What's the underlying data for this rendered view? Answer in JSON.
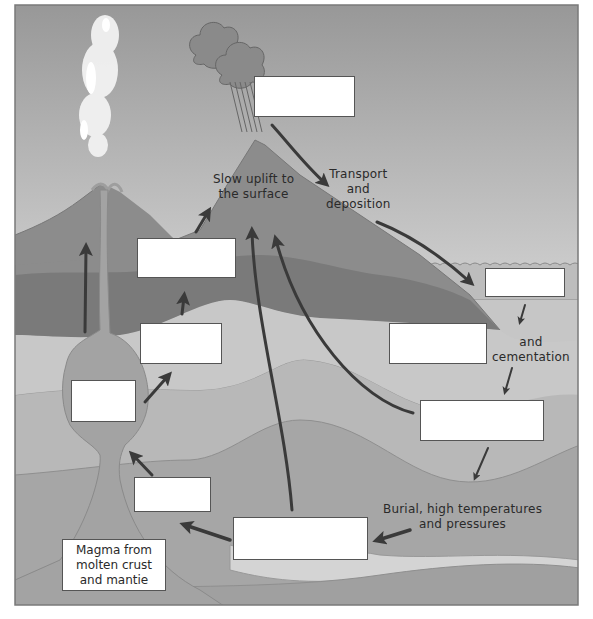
{
  "diagram": {
    "colors": {
      "sky_top": "#9a9a9a",
      "sky_bottom": "#f4f4f4",
      "mountain_light": "#8a8a8a",
      "mountain_dark": "#777777",
      "layer_light": "#c6c6c6",
      "layer_mid": "#b3b3b3",
      "layer_deep": "#a2a2a2",
      "magma": "#9c9c9c",
      "water": "#bdbdbd",
      "arrow": "#3a3a3a"
    },
    "labels": {
      "uplift": [
        "Slow uplift to",
        "the surface"
      ],
      "transport": [
        "Transport",
        "and",
        "deposition"
      ],
      "cementation": [
        "and",
        "cementation"
      ],
      "burial": [
        "Burial, high temperatures",
        "and pressures"
      ],
      "magma": [
        "Magma from",
        "molten crust",
        "and mantie"
      ]
    },
    "blank_boxes": [
      {
        "id": "weathering",
        "value": ""
      },
      {
        "id": "sediment",
        "value": ""
      },
      {
        "id": "sedimentary-rock",
        "value": ""
      },
      {
        "id": "compaction",
        "value": ""
      },
      {
        "id": "metamorphic-rock",
        "value": ""
      },
      {
        "id": "melting",
        "value": ""
      },
      {
        "id": "igneous-rock",
        "value": ""
      },
      {
        "id": "crystallisation",
        "value": ""
      },
      {
        "id": "extrusive",
        "value": ""
      },
      {
        "id": "intrusive",
        "value": ""
      },
      {
        "id": "magma-chamber",
        "value": ""
      }
    ]
  }
}
